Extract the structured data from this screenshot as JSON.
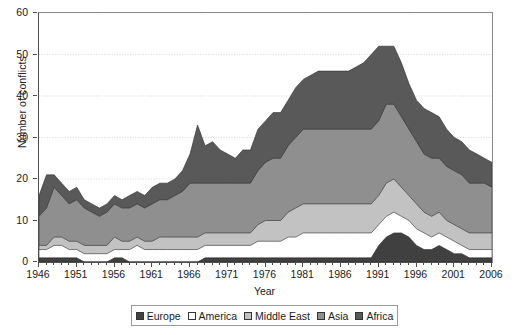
{
  "chart_data": {
    "type": "area",
    "stacked": true,
    "title": "",
    "xlabel": "Year",
    "ylabel": "Number of conflicts",
    "xlim": [
      1946,
      2006
    ],
    "ylim": [
      0,
      60
    ],
    "ytick_step": 10,
    "xtick_step": 5,
    "grid": true,
    "legend_position": "bottom",
    "x": [
      1946,
      1947,
      1948,
      1949,
      1950,
      1951,
      1952,
      1953,
      1954,
      1955,
      1956,
      1957,
      1958,
      1959,
      1960,
      1961,
      1962,
      1963,
      1964,
      1965,
      1966,
      1967,
      1968,
      1969,
      1970,
      1971,
      1972,
      1973,
      1974,
      1975,
      1976,
      1977,
      1978,
      1979,
      1980,
      1981,
      1982,
      1983,
      1984,
      1985,
      1986,
      1987,
      1988,
      1989,
      1990,
      1991,
      1992,
      1993,
      1994,
      1995,
      1996,
      1997,
      1998,
      1999,
      2000,
      2001,
      2002,
      2003,
      2004,
      2005,
      2006
    ],
    "xticks": [
      1946,
      1951,
      1956,
      1961,
      1966,
      1971,
      1976,
      1981,
      1986,
      1991,
      1996,
      2001,
      2006
    ],
    "yticks": [
      0,
      10,
      20,
      30,
      40,
      50,
      60
    ],
    "series": [
      {
        "name": "Europe",
        "color": "#404040",
        "values": [
          1,
          1,
          1,
          1,
          1,
          1,
          0,
          0,
          0,
          0,
          1,
          1,
          0,
          0,
          0,
          0,
          0,
          0,
          0,
          0,
          0,
          0,
          1,
          1,
          1,
          1,
          1,
          1,
          1,
          1,
          1,
          1,
          1,
          1,
          1,
          1,
          1,
          1,
          1,
          1,
          1,
          1,
          1,
          1,
          1,
          4,
          6,
          7,
          7,
          6,
          4,
          3,
          3,
          4,
          3,
          2,
          2,
          1,
          1,
          1,
          1
        ]
      },
      {
        "name": "America",
        "color": "#ffffff",
        "values": [
          2,
          2,
          3,
          3,
          2,
          2,
          2,
          2,
          2,
          2,
          2,
          2,
          3,
          4,
          3,
          3,
          3,
          3,
          3,
          3,
          3,
          3,
          3,
          3,
          3,
          3,
          3,
          3,
          3,
          4,
          4,
          4,
          4,
          5,
          5,
          6,
          6,
          6,
          6,
          6,
          6,
          6,
          6,
          6,
          6,
          5,
          5,
          5,
          4,
          4,
          4,
          4,
          3,
          3,
          3,
          3,
          2,
          2,
          2,
          2,
          2
        ]
      },
      {
        "name": "Middle East",
        "color": "#c2c2c2",
        "values": [
          1,
          1,
          2,
          2,
          2,
          2,
          2,
          2,
          2,
          2,
          3,
          2,
          2,
          2,
          2,
          2,
          3,
          3,
          3,
          3,
          3,
          3,
          3,
          3,
          3,
          3,
          3,
          3,
          3,
          4,
          5,
          5,
          5,
          6,
          7,
          7,
          7,
          7,
          7,
          7,
          7,
          7,
          7,
          7,
          7,
          7,
          8,
          8,
          7,
          6,
          6,
          5,
          5,
          5,
          4,
          4,
          4,
          4,
          4,
          4,
          4
        ]
      },
      {
        "name": "Asia",
        "color": "#8f8f8f",
        "values": [
          7,
          9,
          12,
          10,
          9,
          10,
          9,
          8,
          7,
          8,
          8,
          8,
          8,
          8,
          8,
          9,
          9,
          9,
          10,
          11,
          13,
          13,
          12,
          12,
          12,
          12,
          12,
          12,
          12,
          13,
          14,
          15,
          15,
          16,
          17,
          18,
          18,
          18,
          18,
          18,
          18,
          18,
          18,
          18,
          18,
          18,
          19,
          18,
          17,
          16,
          15,
          14,
          14,
          13,
          13,
          13,
          13,
          12,
          12,
          12,
          11
        ]
      },
      {
        "name": "Africa",
        "color": "#595959",
        "values": [
          5,
          8,
          3,
          3,
          3,
          3,
          2,
          2,
          2,
          2,
          2,
          2,
          3,
          3,
          3,
          4,
          4,
          4,
          4,
          5,
          7,
          14,
          9,
          10,
          8,
          7,
          6,
          8,
          8,
          10,
          10,
          11,
          11,
          11,
          12,
          12,
          13,
          14,
          14,
          14,
          14,
          14,
          15,
          16,
          18,
          18,
          14,
          14,
          13,
          11,
          10,
          11,
          11,
          10,
          9,
          8,
          8,
          8,
          7,
          6,
          6
        ]
      }
    ]
  },
  "legend": {
    "items": [
      {
        "label": "Europe"
      },
      {
        "label": "America"
      },
      {
        "label": "Middle East"
      },
      {
        "label": "Asia"
      },
      {
        "label": "Africa"
      }
    ]
  }
}
